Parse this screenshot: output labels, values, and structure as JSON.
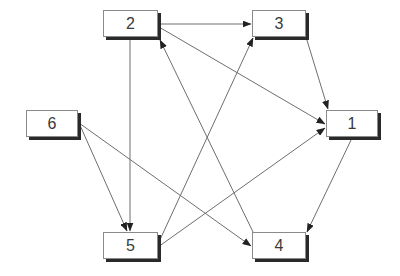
{
  "diagram": {
    "type": "directed-graph",
    "colors": {
      "edge": "#6e6e6e",
      "arrow": "#222222",
      "node_border": "#8a8a8a",
      "node_shadow": "#2a2a2a",
      "text": "#3a3a3a"
    },
    "nodes": [
      {
        "id": "1",
        "label": "1",
        "x": 326,
        "y": 110,
        "w": 52,
        "h": 27
      },
      {
        "id": "2",
        "label": "2",
        "x": 103,
        "y": 10,
        "w": 55,
        "h": 27
      },
      {
        "id": "3",
        "label": "3",
        "x": 252,
        "y": 10,
        "w": 54,
        "h": 27
      },
      {
        "id": "4",
        "label": "4",
        "x": 252,
        "y": 232,
        "w": 54,
        "h": 27
      },
      {
        "id": "5",
        "label": "5",
        "x": 103,
        "y": 232,
        "w": 55,
        "h": 27
      },
      {
        "id": "6",
        "label": "6",
        "x": 26,
        "y": 110,
        "w": 52,
        "h": 27
      }
    ],
    "edges": [
      {
        "from": "2",
        "to": "3",
        "x1": 159,
        "y1": 24,
        "x2": 251,
        "y2": 24
      },
      {
        "from": "2",
        "to": "1",
        "x1": 159,
        "y1": 27,
        "x2": 325,
        "y2": 124
      },
      {
        "from": "2",
        "to": "5",
        "x1": 130,
        "y1": 38,
        "x2": 130,
        "y2": 231
      },
      {
        "from": "3",
        "to": "1",
        "x1": 306,
        "y1": 37,
        "x2": 328,
        "y2": 109
      },
      {
        "from": "5",
        "to": "3",
        "x1": 158,
        "y1": 244,
        "x2": 253,
        "y2": 38
      },
      {
        "from": "5",
        "to": "1",
        "x1": 158,
        "y1": 247,
        "x2": 325,
        "y2": 128
      },
      {
        "from": "4",
        "to": "2",
        "x1": 253,
        "y1": 232,
        "x2": 160,
        "y2": 40
      },
      {
        "from": "6",
        "to": "5",
        "x1": 79,
        "y1": 123,
        "x2": 127,
        "y2": 231
      },
      {
        "from": "6",
        "to": "4",
        "x1": 79,
        "y1": 123,
        "x2": 251,
        "y2": 246
      },
      {
        "from": "1",
        "to": "4",
        "x1": 352,
        "y1": 138,
        "x2": 307,
        "y2": 232
      }
    ]
  }
}
